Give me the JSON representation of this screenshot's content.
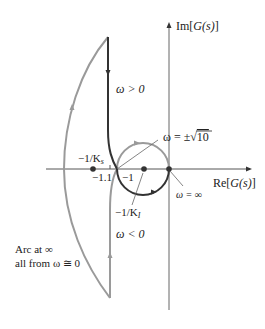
{
  "diagram": {
    "type": "nyquist-plot",
    "axes": {
      "x_label": {
        "prefix": "Re[",
        "var": "G(s)",
        "suffix": "]"
      },
      "y_label": {
        "prefix": "Im[",
        "var": "G(s)",
        "suffix": "]"
      }
    },
    "tick_labels": {
      "minus_1_1": "−1.1",
      "minus_1": "−1"
    },
    "point_labels": {
      "minus_1_over_Ks": "−1/K",
      "Ks_sub": "s",
      "minus_1_over_KI": "−1/K",
      "KI_sub": "I"
    },
    "annotations": {
      "omega_pos": "ω > 0",
      "omega_neg": "ω < 0",
      "omega_sqrt10_prefix": "ω = ±",
      "omega_sqrt10_value": "10",
      "omega_inf": "ω = ∞",
      "arc_line1": "Arc at ∞",
      "arc_line2": "all from ω ≅ 0"
    },
    "colors": {
      "positive_branch": "#333333",
      "negative_branch": "#9a9a9a",
      "axis": "#555555"
    }
  }
}
